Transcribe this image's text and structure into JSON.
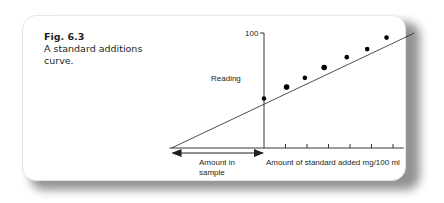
{
  "figure": {
    "number_label": "Fig. 6.3",
    "caption": "A standard additions curve."
  },
  "chart_data": {
    "type": "scatter",
    "title": "A standard additions curve.",
    "xlabel": "Amount of standard added mg/100 ml",
    "ylabel": "Reading",
    "y_tick_labels": [
      "100"
    ],
    "ylim": [
      0,
      100
    ],
    "xlim": [
      -4,
      7
    ],
    "x_ticks": [
      1,
      2,
      3,
      4,
      5,
      6
    ],
    "grid": false,
    "annotation": {
      "label_line1": "Amount in",
      "label_line2": "sample",
      "span_x": [
        -4.3,
        0
      ]
    },
    "points": [
      {
        "x": 0,
        "y": 43
      },
      {
        "x": 1.05,
        "y": 53
      },
      {
        "x": 1.9,
        "y": 61
      },
      {
        "x": 2.8,
        "y": 70
      },
      {
        "x": 3.85,
        "y": 79
      },
      {
        "x": 4.8,
        "y": 86
      },
      {
        "x": 5.7,
        "y": 96
      }
    ],
    "fit_line": {
      "x_start": -4.3,
      "y_start": 0,
      "x_end": 7,
      "y_end": 100
    }
  }
}
